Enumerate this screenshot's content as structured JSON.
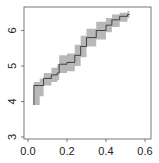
{
  "chart_data": {
    "type": "line",
    "title": "",
    "xlabel": "",
    "ylabel": "",
    "xlim": [
      0.0,
      0.6
    ],
    "ylim": [
      3.0,
      6.6
    ],
    "xticks": [
      "0.0",
      "0.2",
      "0.4",
      "0.6"
    ],
    "yticks": [
      "3",
      "4",
      "5",
      "6"
    ],
    "grid": false,
    "legend": null,
    "series": [
      {
        "name": "estimate",
        "style": "step",
        "color": "#333333",
        "x": [
          0.03,
          0.03,
          0.06,
          0.08,
          0.12,
          0.15,
          0.16,
          0.2,
          0.24,
          0.27,
          0.3,
          0.35,
          0.4,
          0.43,
          0.47,
          0.51
        ],
        "y": [
          3.9,
          4.45,
          4.45,
          4.65,
          4.75,
          4.8,
          5.05,
          5.1,
          5.3,
          5.55,
          5.8,
          6.0,
          6.15,
          6.3,
          6.4,
          6.45
        ]
      },
      {
        "name": "confidence-band",
        "style": "ribbon",
        "color": "#b8b8b8",
        "x": [
          0.03,
          0.03,
          0.06,
          0.08,
          0.12,
          0.15,
          0.16,
          0.2,
          0.24,
          0.27,
          0.3,
          0.35,
          0.4,
          0.43,
          0.47,
          0.51
        ],
        "lower": [
          3.05,
          3.9,
          4.15,
          4.45,
          4.55,
          4.6,
          4.8,
          4.85,
          5.0,
          5.25,
          5.55,
          5.75,
          5.95,
          6.1,
          6.25,
          6.35
        ],
        "upper": [
          4.2,
          4.55,
          4.65,
          4.8,
          4.95,
          5.05,
          5.3,
          5.35,
          5.6,
          5.85,
          6.05,
          6.25,
          6.35,
          6.45,
          6.5,
          6.55
        ]
      }
    ]
  },
  "axes": {
    "x_tick_labels": [
      "0.0",
      "0.2",
      "0.4",
      "0.6"
    ],
    "y_tick_labels": [
      "3",
      "4",
      "5",
      "6"
    ]
  }
}
